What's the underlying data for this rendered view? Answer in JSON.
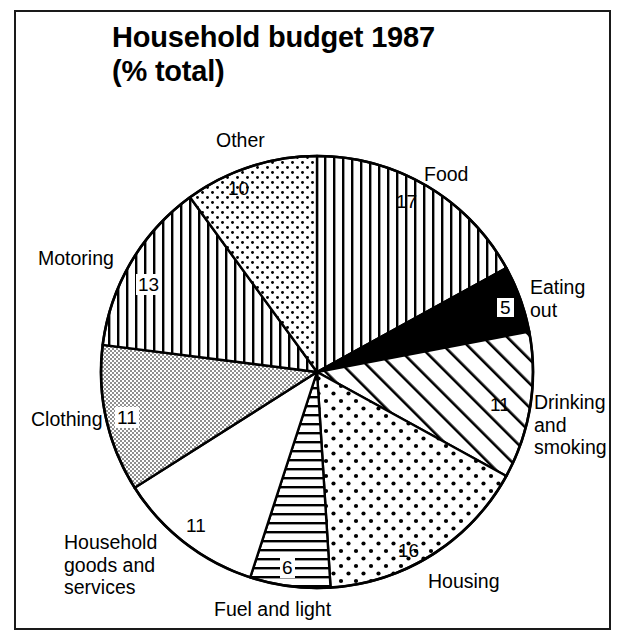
{
  "title": "Household budget 1987\n(% total)",
  "chart_data": {
    "type": "pie",
    "title": "Household budget 1987 (% total)",
    "unit": "% total",
    "total": 100,
    "start_angle_deg": 0,
    "direction": "clockwise",
    "categories": [
      "Food",
      "Eating out",
      "Drinking and smoking",
      "Housing",
      "Fuel and light",
      "Household goods and services",
      "Clothing",
      "Motoring",
      "Other"
    ],
    "values": [
      17,
      5,
      11,
      16,
      6,
      11,
      11,
      13,
      10
    ],
    "slices": [
      {
        "label": "Food",
        "label_text": "Food",
        "value": 17,
        "value_text": "17",
        "fill": "vertical-lines",
        "label_style": "plain"
      },
      {
        "label": "Eating out",
        "label_text": "Eating\nout",
        "value": 5,
        "value_text": "5",
        "fill": "solid-black",
        "label_style": "boxed"
      },
      {
        "label": "Drinking and smoking",
        "label_text": "Drinking\nand\nsmoking",
        "value": 11,
        "value_text": "11",
        "fill": "diagonal-hatch",
        "label_style": "plain"
      },
      {
        "label": "Housing",
        "label_text": "Housing",
        "value": 16,
        "value_text": "16",
        "fill": "coarse-dots",
        "label_style": "plain"
      },
      {
        "label": "Fuel and light",
        "label_text": "Fuel and light",
        "value": 6,
        "value_text": "6",
        "fill": "horizontal-lines",
        "label_style": "boxed"
      },
      {
        "label": "Household goods and services",
        "label_text": "Household\ngoods and\nservices",
        "value": 11,
        "value_text": "11",
        "fill": "white",
        "label_style": "plain"
      },
      {
        "label": "Clothing",
        "label_text": "Clothing",
        "value": 11,
        "value_text": "11",
        "fill": "fine-stipple",
        "label_style": "boxed"
      },
      {
        "label": "Motoring",
        "label_text": "Motoring",
        "value": 13,
        "value_text": "13",
        "fill": "vertical-lines",
        "label_style": "boxed"
      },
      {
        "label": "Other",
        "label_text": "Other",
        "value": 10,
        "value_text": "10",
        "fill": "fine-dots",
        "label_style": "plain"
      }
    ],
    "legend": "inline-labels",
    "grid": false
  }
}
